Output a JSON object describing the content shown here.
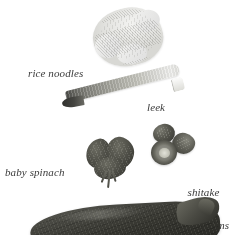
{
  "page": {
    "background_color": "#ffffff",
    "label_color": "#3a3a3a",
    "width": 237,
    "height": 235
  },
  "labels": {
    "rice_noodles": "rice noodles",
    "leek": "leek",
    "baby_spinach": "baby spinach",
    "shitake_line1": "shitake",
    "shitake_line2": "mushrooms"
  },
  "items": [
    {
      "name": "rice-noodles",
      "label": "rice noodles",
      "color": "#e6e6e3",
      "description": "pale bundled nest of dried rice noodles"
    },
    {
      "name": "leek",
      "label": "leek",
      "color": "#a9a9a1",
      "description": "diagonal leek stalk, dark green end at lower left fading to white cut end at upper right"
    },
    {
      "name": "baby-spinach",
      "label": "baby spinach",
      "color": "#4a4a43",
      "description": "cluster of dark baby spinach leaves with stems"
    },
    {
      "name": "shitake-mushrooms",
      "label": "shitake mushrooms",
      "color": "#55554d",
      "description": "three dark shitake mushroom caps, one showing pale gills"
    },
    {
      "name": "meat-slab",
      "label": "",
      "color": "#35352f",
      "description": "large dark cut of meat cropped by the bottom edge, unlabeled"
    }
  ]
}
